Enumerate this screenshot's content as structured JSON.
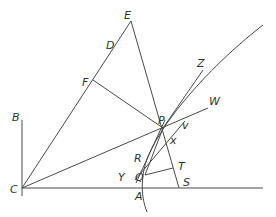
{
  "figure": {
    "type": "geometric-diagram",
    "labels": {
      "E": "E",
      "D": "D",
      "F": "F",
      "Z": "Z",
      "W": "W",
      "P": "P",
      "v": "v",
      "x": "x",
      "B": "B",
      "R": "R",
      "T": "T",
      "Y": "Y",
      "Q": "Q",
      "C": "C",
      "S": "S",
      "A": "A"
    },
    "colors": {
      "line": "#4a4a4a",
      "text": "#333333",
      "background": "#ffffff"
    }
  }
}
